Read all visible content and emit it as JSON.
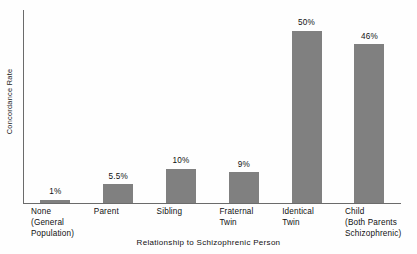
{
  "chart_data": {
    "type": "bar",
    "title": "",
    "xlabel": "Relationship to Schizophrenic Person",
    "ylabel": "Concordance Rate",
    "categories": [
      "None (General Population)",
      "Parent",
      "Sibling",
      "Fraternal Twin",
      "Identical Twin",
      "Child (Both Parents Schizophrenic)"
    ],
    "category_lines": [
      [
        "None",
        "(General",
        "Population)"
      ],
      [
        "Parent"
      ],
      [
        "Sibling"
      ],
      [
        "Fraternal",
        "Twin"
      ],
      [
        "Identical",
        "Twin"
      ],
      [
        "Child",
        "(Both Parents",
        "Schizophrenic)"
      ]
    ],
    "values": [
      1,
      5.5,
      10,
      9,
      50,
      46
    ],
    "value_labels": [
      "1%",
      "5.5%",
      "10%",
      "9%",
      "50%",
      "46%"
    ],
    "units": "percent",
    "ylim": [
      0,
      56
    ],
    "grid": false,
    "legend": null,
    "bar_color": "#808080",
    "axis_color": "#6b6b6b",
    "text_color": "#111111",
    "background": "#fefefe"
  }
}
